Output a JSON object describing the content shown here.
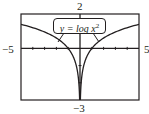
{
  "chart_data": {
    "type": "line",
    "title": "",
    "xlabel": "",
    "ylabel": "",
    "xlim": [
      -5,
      5
    ],
    "ylim": [
      -3,
      2
    ],
    "grid": false,
    "x_ticks": [
      -4,
      -3,
      -2,
      -1,
      1,
      2,
      3,
      4
    ],
    "y_ticks": [
      -2,
      -1,
      1
    ],
    "window_labels": {
      "xmin": "−5",
      "xmax": "5",
      "ymin": "−3",
      "ymax": "2"
    },
    "annotations": [
      {
        "text": "y = log x²",
        "type": "callout",
        "points_to": [
          "left branch",
          "right branch"
        ]
      }
    ],
    "series": [
      {
        "name": "y = log x^2",
        "function": "log10(x^2)",
        "x": [
          -5,
          -4,
          -3,
          -2,
          -1,
          -0.5,
          -0.2,
          -0.1,
          0.1,
          0.2,
          0.5,
          1,
          2,
          3,
          4,
          5
        ],
        "y": [
          1.4,
          1.2,
          0.95,
          0.6,
          0,
          -0.6,
          -1.4,
          -2.0,
          -2.0,
          -1.4,
          -0.6,
          0,
          0.6,
          0.95,
          1.2,
          1.4
        ]
      }
    ]
  },
  "labels": {
    "top": "2",
    "bottom": "−3",
    "left": "−5",
    "right": "5",
    "equation_prefix": "y = log x",
    "equation_exp": "2"
  },
  "colors": {
    "frame": "#231f20",
    "curve": "#231f20",
    "background": "#ffffff"
  }
}
